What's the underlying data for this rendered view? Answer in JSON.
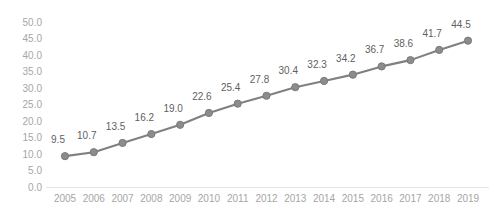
{
  "chart_data": {
    "type": "line",
    "title": "",
    "subtitle": "",
    "xlabel": "",
    "ylabel": "",
    "categories": [
      "2005",
      "2006",
      "2007",
      "2008",
      "2009",
      "2010",
      "2011",
      "2012",
      "2013",
      "2014",
      "2015",
      "2016",
      "2017",
      "2018",
      "2019"
    ],
    "values": [
      9.5,
      10.7,
      13.5,
      16.2,
      19.0,
      22.6,
      25.4,
      27.8,
      30.4,
      32.3,
      34.2,
      36.7,
      38.6,
      41.7,
      44.5
    ],
    "value_labels": [
      "9.5",
      "10.7",
      "13.5",
      "16.2",
      "19.0",
      "22.6",
      "25.4",
      "27.8",
      "30.4",
      "32.3",
      "34.2",
      "36.7",
      "38.6",
      "41.7",
      "44.5"
    ],
    "ylim": [
      0,
      50
    ],
    "ytick_values": [
      0,
      5,
      10,
      15,
      20,
      25,
      30,
      35,
      40,
      45,
      50
    ],
    "ytick_labels": [
      "0.0",
      "5.0",
      "10.0",
      "15.0",
      "20.0",
      "25.0",
      "30.0",
      "35.0",
      "40.0",
      "45.0",
      "50.0"
    ],
    "grid": false,
    "legend": "none",
    "data_labels_shown": true,
    "marker": "circle",
    "colors": {
      "line": "#808080",
      "marker_fill": "#8c8c8c",
      "marker_stroke": "#7a7a7a",
      "axis_line": "#e4e4e4",
      "tick_label": "#a6a6a6",
      "data_label": "#5f5f5f",
      "background": "#ffffff"
    }
  }
}
